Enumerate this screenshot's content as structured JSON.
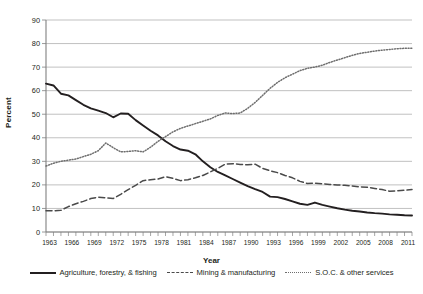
{
  "figure": {
    "ghost_text": "",
    "ylabel": "Percent",
    "xlabel": "Year"
  },
  "legend": {
    "position": "bottom",
    "items": [
      {
        "label": "Agriculture, forestry, & fishing",
        "style": "solid",
        "color": "#231f20"
      },
      {
        "label": "Mining & manufacturing",
        "style": "dashed",
        "color": "#4a4a4a"
      },
      {
        "label": "S.O.C. & other services",
        "style": "dotted",
        "color": "#6e6e6e"
      }
    ]
  },
  "chart_data": {
    "type": "line",
    "title": "",
    "xlabel": "Year",
    "ylabel": "Percent",
    "xlim": [
      1963,
      2012
    ],
    "ylim": [
      0,
      90
    ],
    "grid": true,
    "legend_position": "bottom",
    "ytick_labels": [
      "0",
      "10",
      "20",
      "30",
      "40",
      "50",
      "60",
      "70",
      "80",
      "90"
    ],
    "ytick_values": [
      0,
      10,
      20,
      30,
      40,
      50,
      60,
      70,
      80,
      90
    ],
    "xtick_labels": [
      "1963",
      "1966",
      "1969",
      "1972",
      "1975",
      "1978",
      "1981",
      "1984",
      "1987",
      "1990",
      "1993",
      "1996",
      "1999",
      "2002",
      "2005",
      "2008",
      "2011"
    ],
    "xtick_values": [
      1963,
      1966,
      1969,
      1972,
      1975,
      1978,
      1981,
      1984,
      1987,
      1990,
      1993,
      1996,
      1999,
      2002,
      2005,
      2008,
      2011
    ],
    "x": [
      1963,
      1964,
      1965,
      1966,
      1967,
      1968,
      1969,
      1970,
      1971,
      1972,
      1973,
      1974,
      1975,
      1976,
      1977,
      1978,
      1979,
      1980,
      1981,
      1982,
      1983,
      1984,
      1985,
      1986,
      1987,
      1988,
      1989,
      1990,
      1991,
      1992,
      1993,
      1994,
      1995,
      1996,
      1997,
      1998,
      1999,
      2000,
      2001,
      2002,
      2003,
      2004,
      2005,
      2006,
      2007,
      2008,
      2009,
      2010,
      2011,
      2012
    ],
    "series": [
      {
        "name": "Agriculture, forestry, & fishing",
        "style": "solid",
        "color": "#231f20",
        "values": [
          63.0,
          62.2,
          58.7,
          58.0,
          56.0,
          54.0,
          52.5,
          51.5,
          50.5,
          48.7,
          50.3,
          50.2,
          47.5,
          45.2,
          43.0,
          41.0,
          38.5,
          36.5,
          35.0,
          34.5,
          33.0,
          30.0,
          27.5,
          25.5,
          24.0,
          22.5,
          21.0,
          19.5,
          18.2,
          17.0,
          15.0,
          14.8,
          14.0,
          13.0,
          12.0,
          11.5,
          12.5,
          11.5,
          10.8,
          10.1,
          9.5,
          9.0,
          8.7,
          8.3,
          8.0,
          7.8,
          7.5,
          7.3,
          7.1,
          7.0
        ]
      },
      {
        "name": "Mining & manufacturing",
        "style": "dashed",
        "color": "#4a4a4a",
        "values": [
          9.0,
          9.0,
          9.2,
          10.8,
          12.0,
          13.0,
          14.2,
          14.8,
          14.5,
          14.2,
          16.0,
          18.0,
          19.8,
          21.8,
          22.2,
          22.5,
          23.5,
          22.8,
          21.8,
          22.2,
          23.0,
          24.0,
          25.5,
          27.0,
          28.8,
          29.0,
          28.7,
          28.5,
          28.8,
          27.0,
          26.0,
          25.2,
          24.0,
          23.0,
          21.5,
          20.6,
          20.7,
          20.5,
          20.2,
          20.0,
          19.8,
          19.5,
          19.2,
          19.0,
          18.5,
          18.0,
          17.3,
          17.5,
          17.7,
          18.0
        ]
      },
      {
        "name": "S.O.C. & other services",
        "style": "dotted",
        "color": "#6e6e6e",
        "values": [
          28.0,
          29.2,
          30.0,
          30.5,
          31.0,
          32.0,
          33.0,
          34.5,
          37.8,
          35.8,
          34.0,
          34.2,
          34.5,
          34.0,
          36.0,
          38.5,
          40.5,
          42.5,
          44.0,
          45.0,
          46.0,
          47.0,
          48.0,
          49.5,
          50.5,
          50.3,
          50.5,
          52.5,
          55.0,
          58.0,
          61.0,
          63.5,
          65.5,
          67.0,
          68.5,
          69.5,
          70.0,
          70.8,
          72.0,
          73.0,
          74.0,
          75.0,
          75.8,
          76.3,
          76.8,
          77.2,
          77.5,
          77.8,
          78.0,
          78.0
        ]
      }
    ]
  }
}
